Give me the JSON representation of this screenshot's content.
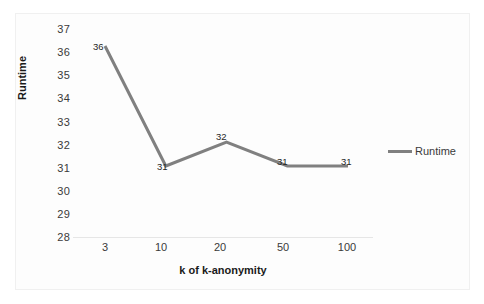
{
  "chart_data": {
    "type": "line",
    "title": "",
    "subtitle": "",
    "xlabel": "k of k-anonymity",
    "ylabel": "Runtime",
    "categories": [
      "3",
      "10",
      "20",
      "50",
      "100"
    ],
    "x": [
      3,
      10,
      20,
      50,
      100
    ],
    "series": [
      {
        "name": "Runtime",
        "values": [
          36,
          31,
          32,
          31,
          31
        ],
        "color": "#808080"
      }
    ],
    "point_labels": [
      "36",
      "31",
      "32",
      "31",
      "31"
    ],
    "ylim": [
      28,
      37
    ],
    "y_ticks": [
      "37",
      "36",
      "35",
      "34",
      "33",
      "32",
      "31",
      "30",
      "29",
      "28"
    ],
    "x_ticks": [
      "3",
      "10",
      "20",
      "50",
      "100"
    ],
    "grid": false,
    "legend_position": "right",
    "legend_entries": [
      "Runtime"
    ]
  },
  "legend": {
    "runtime_label": "Runtime"
  },
  "axes": {
    "y_title": "Runtime",
    "x_title": "k of k-anonymity"
  },
  "colors": {
    "series_line": "#808080",
    "axis_line": "#e6e6e6",
    "tick_text": "#3a3a3a",
    "title_text": "#1a1a1a",
    "plot_background": "#fdfdfd",
    "frame_border": "#f0f0f0"
  }
}
